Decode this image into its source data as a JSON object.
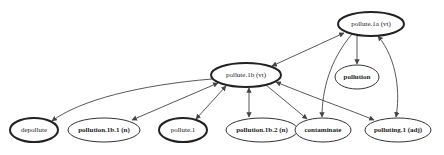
{
  "diagram": {
    "type": "directed-graph",
    "nodes": [
      {
        "id": "pollute_1a",
        "label": "pollute.1a (vt)",
        "cx": 371,
        "cy": 24,
        "rx": 33,
        "ry": 12,
        "emphasis": "thick"
      },
      {
        "id": "pollution",
        "label": "pollution",
        "cx": 357,
        "cy": 77,
        "rx": 22,
        "ry": 12,
        "emphasis": "thin"
      },
      {
        "id": "pollute_1b",
        "label": "pollute.1b (vt)",
        "cx": 246,
        "cy": 75,
        "rx": 35,
        "ry": 12,
        "emphasis": "thick"
      },
      {
        "id": "depollute",
        "label": "depollute",
        "cx": 34,
        "cy": 130,
        "rx": 24,
        "ry": 12,
        "emphasis": "thick"
      },
      {
        "id": "pollution_1b_1",
        "label": "pollution.1b.1 (n)",
        "cx": 104,
        "cy": 130,
        "rx": 36,
        "ry": 12,
        "emphasis": "thin"
      },
      {
        "id": "pollute_1",
        "label": "pollute.1",
        "cx": 183,
        "cy": 130,
        "rx": 24,
        "ry": 12,
        "emphasis": "thick"
      },
      {
        "id": "pollution_1b_2",
        "label": "pollution.1b.2 (n)",
        "cx": 262,
        "cy": 130,
        "rx": 36,
        "ry": 12,
        "emphasis": "thin"
      },
      {
        "id": "contaminate",
        "label": "contaminate",
        "cx": 323,
        "cy": 130,
        "rx": 28,
        "ry": 12,
        "emphasis": "thin"
      },
      {
        "id": "polluting_1",
        "label": "polluting.1 (adj)",
        "cx": 398,
        "cy": 130,
        "rx": 33,
        "ry": 12,
        "emphasis": "thin"
      }
    ],
    "edges": [
      {
        "from": "pollute_1a",
        "to": "pollute_1b",
        "direction": "both"
      },
      {
        "from": "pollute_1a",
        "to": "pollution",
        "direction": "forward"
      },
      {
        "from": "pollute_1a",
        "to": "contaminate",
        "direction": "forward"
      },
      {
        "from": "pollute_1a",
        "to": "polluting_1",
        "direction": "both"
      },
      {
        "from": "pollute_1b",
        "to": "depollute",
        "direction": "forward"
      },
      {
        "from": "pollute_1b",
        "to": "pollution_1b_1",
        "direction": "both"
      },
      {
        "from": "pollute_1b",
        "to": "pollute_1",
        "direction": "both"
      },
      {
        "from": "pollute_1b",
        "to": "pollution_1b_2",
        "direction": "both"
      },
      {
        "from": "pollute_1b",
        "to": "contaminate",
        "direction": "forward"
      },
      {
        "from": "pollute_1b",
        "to": "polluting_1",
        "direction": "both"
      }
    ]
  },
  "labels": {
    "pollute_1a": "pollute.1a (vt)",
    "pollution": "pollution",
    "pollute_1b": "pollute.1b (vt)",
    "depollute": "depollute",
    "pollution_1b_1": "pollution.1b.1 (n)",
    "pollute_1": "pollute.1",
    "pollution_1b_2": "pollution.1b.2 (n)",
    "contaminate": "contaminate",
    "polluting_1": "polluting.1 (adj)"
  },
  "colors": {
    "background": "#ffffff",
    "edge": "#444444",
    "node_stroke": "#222222",
    "text": "#222222"
  }
}
